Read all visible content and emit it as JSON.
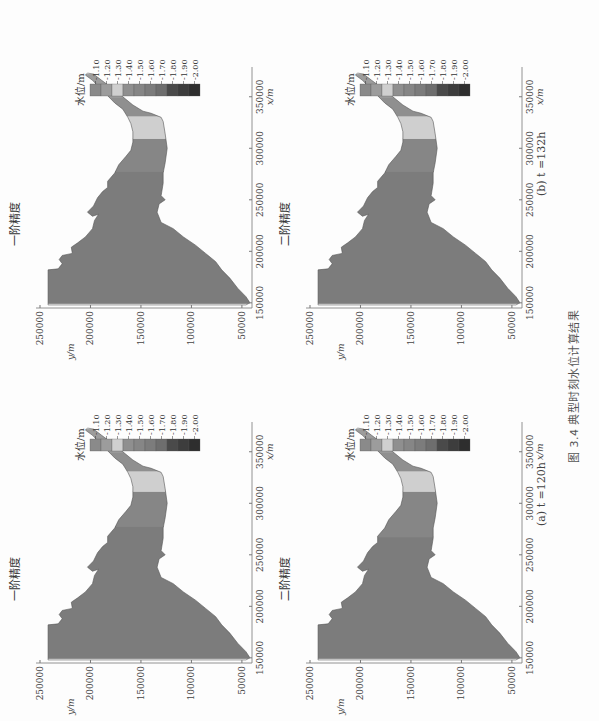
{
  "figure": {
    "caption": "图 3.4   典型时刻水位计算结果",
    "columns": [
      {
        "id": "a",
        "caption": "(a) t =120h"
      },
      {
        "id": "b",
        "caption": "(b) t =132h"
      }
    ],
    "panels": [
      {
        "title": "一阶精度",
        "column": "a",
        "row": "top"
      },
      {
        "title": "二阶精度",
        "column": "a",
        "row": "bottom"
      },
      {
        "title": "一阶精度",
        "column": "b",
        "row": "top"
      },
      {
        "title": "二阶精度",
        "column": "b",
        "row": "bottom"
      }
    ]
  },
  "axes": {
    "xlabel": "x/m",
    "ylabel": "y/m",
    "xticks": [
      "150000",
      "200000",
      "250000",
      "300000",
      "350000"
    ],
    "yticks": [
      "50000",
      "100000",
      "150000",
      "200000",
      "250000"
    ]
  },
  "legend": {
    "title": "水位/m",
    "levels": [
      "-1.10",
      "-1.20",
      "-1.30",
      "-1.40",
      "-1.50",
      "-1.60",
      "-1.70",
      "-1.80",
      "-1.90",
      "-2.00"
    ],
    "colors": [
      "#8a8a8a",
      "#9c9c9c",
      "#cfcfcf",
      "#8f8f8f",
      "#868686",
      "#7c7c7c",
      "#6e6e6e",
      "#4a4a4a",
      "#3d3d3d",
      "#2e2e2e"
    ]
  },
  "chart_data": [
    {
      "type": "heatmap",
      "title": "一阶精度 (a) t=120h",
      "xlabel": "x/m",
      "ylabel": "y/m",
      "xlim": [
        145000,
        375000
      ],
      "ylim": [
        40000,
        250000
      ],
      "legend_title": "水位/m",
      "levels": [
        -1.1,
        -1.2,
        -1.3,
        -1.4,
        -1.5,
        -1.6,
        -1.7,
        -1.8,
        -1.9,
        -2.0
      ],
      "zones": [
        {
          "x_range": [
            150000,
            278000
          ],
          "value": -1.6
        },
        {
          "x_range": [
            278000,
            312000
          ],
          "value": -1.5
        },
        {
          "x_range": [
            312000,
            332000
          ],
          "value": -1.3
        },
        {
          "x_range": [
            332000,
            350000
          ],
          "value": -1.4
        },
        {
          "x_range": [
            350000,
            372000
          ],
          "value": -1.2
        }
      ]
    },
    {
      "type": "heatmap",
      "title": "二阶精度 (a) t=120h",
      "xlabel": "x/m",
      "ylabel": "y/m",
      "xlim": [
        145000,
        375000
      ],
      "ylim": [
        40000,
        250000
      ],
      "legend_title": "水位/m",
      "levels": [
        -1.1,
        -1.2,
        -1.3,
        -1.4,
        -1.5,
        -1.6,
        -1.7,
        -1.8,
        -1.9,
        -2.0
      ],
      "zones": [
        {
          "x_range": [
            150000,
            268000
          ],
          "value": -1.6
        },
        {
          "x_range": [
            268000,
            312000
          ],
          "value": -1.5
        },
        {
          "x_range": [
            312000,
            332000
          ],
          "value": -1.3
        },
        {
          "x_range": [
            332000,
            350000
          ],
          "value": -1.4
        },
        {
          "x_range": [
            350000,
            372000
          ],
          "value": -1.2
        }
      ]
    },
    {
      "type": "heatmap",
      "title": "一阶精度 (b) t=132h",
      "xlabel": "x/m",
      "ylabel": "y/m",
      "xlim": [
        145000,
        375000
      ],
      "ylim": [
        40000,
        250000
      ],
      "legend_title": "水位/m",
      "levels": [
        -1.1,
        -1.2,
        -1.3,
        -1.4,
        -1.5,
        -1.6,
        -1.7,
        -1.8,
        -1.9,
        -2.0
      ],
      "zones": [
        {
          "x_range": [
            150000,
            278000
          ],
          "value": -1.6
        },
        {
          "x_range": [
            278000,
            310000
          ],
          "value": -1.5
        },
        {
          "x_range": [
            310000,
            332000
          ],
          "value": -1.3
        },
        {
          "x_range": [
            332000,
            350000
          ],
          "value": -1.4
        },
        {
          "x_range": [
            350000,
            372000
          ],
          "value": -1.2
        }
      ]
    },
    {
      "type": "heatmap",
      "title": "二阶精度 (b) t=132h",
      "xlabel": "x/m",
      "ylabel": "y/m",
      "xlim": [
        145000,
        375000
      ],
      "ylim": [
        40000,
        250000
      ],
      "legend_title": "水位/m",
      "levels": [
        -1.1,
        -1.2,
        -1.3,
        -1.4,
        -1.5,
        -1.6,
        -1.7,
        -1.8,
        -1.9,
        -2.0
      ],
      "zones": [
        {
          "x_range": [
            150000,
            278000
          ],
          "value": -1.6
        },
        {
          "x_range": [
            278000,
            310000
          ],
          "value": -1.5
        },
        {
          "x_range": [
            310000,
            332000
          ],
          "value": -1.3
        },
        {
          "x_range": [
            332000,
            350000
          ],
          "value": -1.4
        },
        {
          "x_range": [
            350000,
            372000
          ],
          "value": -1.2
        }
      ]
    }
  ]
}
